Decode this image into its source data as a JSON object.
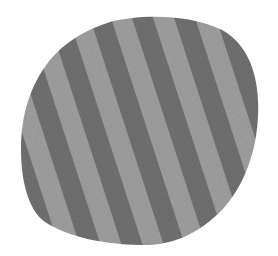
{
  "image": {
    "subject": "striped fabric swatch in irregular rounded shape",
    "background_color": "#ffffff",
    "colors": {
      "stripe_dark": "#717171",
      "stripe_light": "#a0a0a0",
      "texture_noise": "#8a8a8a"
    },
    "stripes": {
      "orientation": "diagonal",
      "angle_deg": 72,
      "band_width_px": 20,
      "count_visible": 12
    },
    "shape": {
      "type": "rounded-irregular-blob",
      "bounds": {
        "left": 21,
        "top": 17,
        "right": 259,
        "bottom": 246
      }
    }
  }
}
